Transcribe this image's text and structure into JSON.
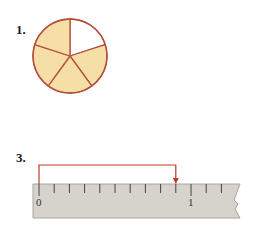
{
  "problems": [
    {
      "number_label": "1.",
      "figure": "circle-fraction",
      "parts_total": 5,
      "parts_shaded": 4,
      "colors": {
        "fill": "#f5dfa6",
        "stroke": "#b4523c",
        "unshaded": "#ffffff"
      }
    },
    {
      "number_label": "3.",
      "figure": "ruler-measure",
      "ruler": {
        "start_label": "0",
        "end_label": "1",
        "divisions": 10,
        "arrow_from": 0,
        "arrow_to": 0.9,
        "colors": {
          "ruler_fill": "#d6d3cc",
          "tick": "#444444",
          "arrow": "#c0392b"
        }
      }
    }
  ]
}
